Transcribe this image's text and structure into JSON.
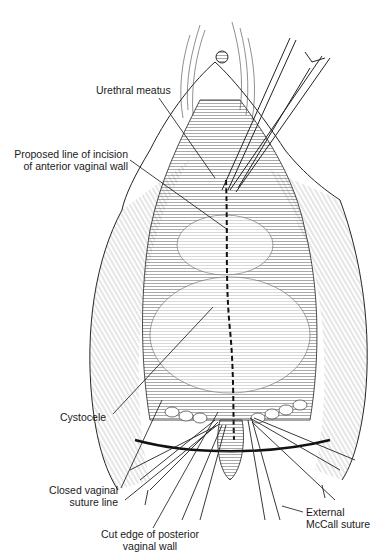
{
  "figure": {
    "type": "surgical line illustration",
    "background": "#ffffff",
    "ink": "#1a1a1a"
  },
  "labels": {
    "urethral_meatus": "Urethral meatus",
    "incision_line1": "Proposed line of incision",
    "incision_line2": "of anterior vaginal wall",
    "cystocele": "Cystocele",
    "closed_suture_line1": "Closed vaginal",
    "closed_suture_line2": "suture line",
    "cut_edge_line1": "Cut edge of posterior",
    "cut_edge_line2": "vaginal wall",
    "mccall_line1": "External",
    "mccall_line2": "McCall suture"
  }
}
